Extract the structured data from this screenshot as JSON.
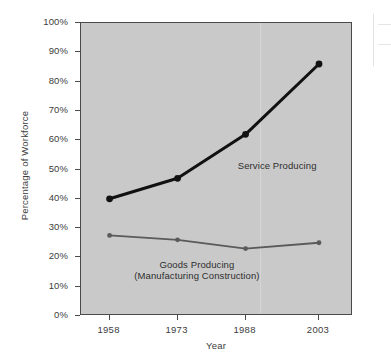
{
  "chart_data": {
    "type": "line",
    "title": "",
    "xlabel": "Year",
    "ylabel": "Percentage of Workforce",
    "categories": [
      "1958",
      "1973",
      "1988",
      "2003"
    ],
    "x": [
      1958,
      1973,
      1988,
      2003
    ],
    "ylim": [
      0,
      100
    ],
    "ytick_labels": [
      "100%",
      "90%",
      "80%",
      "70%",
      "60%",
      "50%",
      "40%",
      "30%",
      "20%",
      "10%",
      "0%"
    ],
    "ytick_values": [
      100,
      90,
      80,
      70,
      60,
      50,
      40,
      30,
      20,
      10,
      0
    ],
    "grid": false,
    "legend": "none",
    "series": [
      {
        "name": "Service Producing",
        "values": [
          40,
          47,
          62,
          86
        ],
        "color": "#111111",
        "marker": "circle",
        "line_width": 3
      },
      {
        "name": "Goods Producing",
        "values": [
          27.5,
          26,
          23,
          25
        ],
        "color": "#5a5a5a",
        "marker": "circle",
        "line_width": 1.8
      }
    ],
    "annotations": [
      {
        "text": "Service Producing",
        "x_pct": 58,
        "y_pct": 53,
        "lines": [
          "Service Producing"
        ]
      },
      {
        "text": "Goods Producing (Manufacturing Construction)",
        "x_pct": 43,
        "y_pct": 19,
        "lines": [
          "Goods Producing",
          "(Manufacturing Construction)"
        ]
      }
    ],
    "plot_background": "#c9c9c9",
    "axis_color": "#4a4a4a"
  }
}
